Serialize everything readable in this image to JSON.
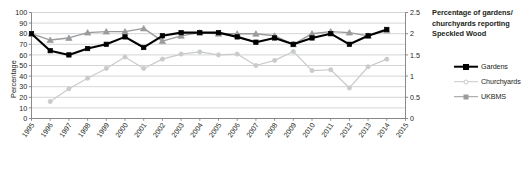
{
  "chart_data": {
    "type": "line",
    "title_lines": [
      "Percentage of gardens/",
      "churchyards reporting",
      "Speckled Wood"
    ],
    "xlabel": "",
    "ylabel": "Percentage",
    "y2label": "UKBMS Index",
    "ylim": [
      0,
      100
    ],
    "y2lim": [
      0,
      2.5
    ],
    "ytick_labels": [
      "0",
      "10",
      "20",
      "30",
      "40",
      "50",
      "60",
      "70",
      "80",
      "90",
      "100"
    ],
    "yticks": [
      0,
      10,
      20,
      30,
      40,
      50,
      60,
      70,
      80,
      90,
      100
    ],
    "y2tick_labels": [
      "0",
      "0.5",
      "1",
      "1.5",
      "2",
      "2.5"
    ],
    "y2ticks": [
      0,
      0.5,
      1,
      1.5,
      2,
      2.5
    ],
    "grid": true,
    "grid_axis": "y",
    "legend_position": "right",
    "categories": [
      "1995",
      "1996",
      "1997",
      "1998",
      "1999",
      "2000",
      "2001",
      "2002",
      "2003",
      "2004",
      "2005",
      "2006",
      "2007",
      "2008",
      "2009",
      "2010",
      "2011",
      "2012",
      "2013",
      "2014",
      "2015"
    ],
    "x": [
      1995,
      1996,
      1997,
      1998,
      1999,
      2000,
      2001,
      2002,
      2003,
      2004,
      2005,
      2006,
      2007,
      2008,
      2009,
      2010,
      2011,
      2012,
      2013,
      2014,
      2015
    ],
    "series": [
      {
        "name": "Gardens",
        "axis": "left",
        "color": "#000000",
        "marker": "square",
        "values": [
          80,
          64,
          60,
          66,
          70,
          77,
          67,
          78,
          81,
          81,
          81,
          77,
          72,
          76,
          70,
          76,
          80,
          70,
          78,
          84,
          null
        ]
      },
      {
        "name": "Churchyards",
        "axis": "left",
        "color": "#8f9092",
        "marker": "triangle",
        "values": [
          80,
          74,
          76,
          81,
          82,
          82,
          85,
          73,
          78,
          81,
          80,
          80,
          80,
          78,
          70,
          80,
          82,
          81,
          78,
          83,
          null
        ]
      },
      {
        "name": "UKBMS",
        "axis": "right",
        "color": "#c9cacc",
        "marker": "circle",
        "values": [
          null,
          0.4,
          0.7,
          0.95,
          1.18,
          1.45,
          1.18,
          1.4,
          1.52,
          1.57,
          1.5,
          1.52,
          1.25,
          1.37,
          1.58,
          1.13,
          1.15,
          0.72,
          1.22,
          1.4,
          null
        ]
      }
    ],
    "legend": [
      {
        "label": "Gardens",
        "color": "#000000",
        "marker": "square"
      },
      {
        "label": "Churchyards",
        "color": "#c9cacc",
        "marker": "circle"
      },
      {
        "label": "UKBMS",
        "color": "#9a9b9d",
        "marker": "square"
      }
    ],
    "colors": {
      "gardens": "#000000",
      "churchyards": "#c9cacc",
      "ukbms": "#9a9b9d",
      "grid": "#c8c9cb",
      "axis": "#7d7e80",
      "text": "#231f20"
    }
  }
}
